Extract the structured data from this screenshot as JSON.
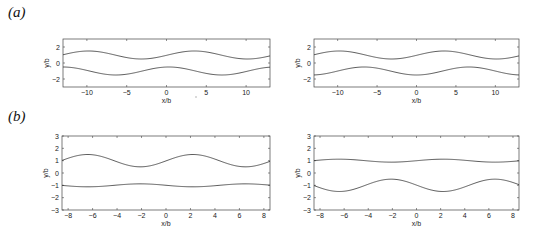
{
  "figure": {
    "panel_labels": [
      {
        "id": "a",
        "text": "(a)",
        "x": 8,
        "y": 6
      },
      {
        "id": "b",
        "text": "(b)",
        "x": 8,
        "y": 112
      }
    ]
  },
  "chart_data": [
    {
      "type": "line",
      "panel": "a-left",
      "title": "",
      "xlabel": "x/b",
      "ylabel": "y/b",
      "xlim": [
        -13,
        13
      ],
      "ylim": [
        -3,
        3
      ],
      "xticks": [
        -10,
        -5,
        0,
        5,
        10
      ],
      "yticks": [
        -2,
        0,
        2
      ],
      "grid": false,
      "box": {
        "left": 63,
        "top": 39,
        "right": 270,
        "bottom": 87
      },
      "series": [
        {
          "name": "upper wall",
          "mean": 1.0,
          "amplitude": 0.5,
          "period": 13.3,
          "peak_x": 3.5
        },
        {
          "name": "lower wall",
          "mean": -1.0,
          "amplitude": 0.5,
          "period": 13.3,
          "peak_x": 0.3
        }
      ]
    },
    {
      "type": "line",
      "panel": "a-right",
      "title": "",
      "xlabel": "x/b",
      "ylabel": "y/b",
      "xlim": [
        -13,
        13
      ],
      "ylim": [
        -3,
        3
      ],
      "xticks": [
        -10,
        -5,
        0,
        5,
        10
      ],
      "yticks": [
        -2,
        0,
        2
      ],
      "grid": false,
      "box": {
        "left": 314,
        "top": 39,
        "right": 519,
        "bottom": 87
      },
      "series": [
        {
          "name": "upper wall",
          "mean": 1.0,
          "amplitude": 0.5,
          "period": 13.3,
          "peak_x": 3.5
        },
        {
          "name": "lower wall",
          "mean": -1.0,
          "amplitude": 0.5,
          "period": 13.3,
          "peak_x": 6.65
        }
      ]
    },
    {
      "type": "line",
      "panel": "b-left",
      "title": "",
      "xlabel": "x/b",
      "ylabel": "y/b",
      "xlim": [
        -8.5,
        8.5
      ],
      "ylim": [
        -3,
        3
      ],
      "xticks": [
        -8,
        -6,
        -4,
        -2,
        0,
        2,
        4,
        6,
        8
      ],
      "yticks": [
        -3,
        -2,
        -1,
        0,
        1,
        2,
        3
      ],
      "grid": false,
      "box": {
        "left": 62,
        "top": 136,
        "right": 270,
        "bottom": 210
      },
      "series": [
        {
          "name": "upper wall",
          "mean": 1.0,
          "amplitude": 0.5,
          "period": 8.6,
          "peak_x": 2.2
        },
        {
          "name": "lower wall",
          "mean": -1.0,
          "amplitude": 0.12,
          "period": 8.6,
          "peak_x": -2.1
        }
      ]
    },
    {
      "type": "line",
      "panel": "b-right",
      "title": "",
      "xlabel": "x/b",
      "ylabel": "y/b",
      "xlim": [
        -8.5,
        8.5
      ],
      "ylim": [
        -3,
        3
      ],
      "xticks": [
        -8,
        -6,
        -4,
        -2,
        0,
        2,
        4,
        6,
        8
      ],
      "yticks": [
        -3,
        -2,
        -1,
        0,
        1,
        2,
        3
      ],
      "grid": false,
      "box": {
        "left": 314,
        "top": 136,
        "right": 519,
        "bottom": 210
      },
      "series": [
        {
          "name": "upper wall",
          "mean": 1.0,
          "amplitude": 0.12,
          "period": 8.6,
          "peak_x": 2.2
        },
        {
          "name": "lower wall",
          "mean": -1.0,
          "amplitude": 0.5,
          "period": 8.6,
          "peak_x": -2.1
        }
      ]
    }
  ]
}
